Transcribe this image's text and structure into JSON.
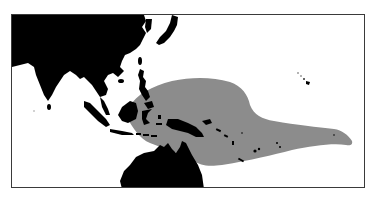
{
  "map": {
    "type": "distribution-range-map",
    "region": "Indo-Pacific (Asia, Indonesia, Australia, western & central Pacific)",
    "colors": {
      "land": "#000000",
      "ocean": "#ffffff",
      "range": "#8c8c8c",
      "frame": "#3a3a3a"
    },
    "layers": [
      {
        "name": "land",
        "label": "Land masses"
      },
      {
        "name": "range",
        "label": "Species distribution range"
      }
    ],
    "landmasses": [
      "Asia",
      "Japan",
      "Philippines",
      "Borneo",
      "Sumatra",
      "Java",
      "Sulawesi",
      "New Guinea",
      "Australia",
      "Hawaiian Islands"
    ]
  }
}
